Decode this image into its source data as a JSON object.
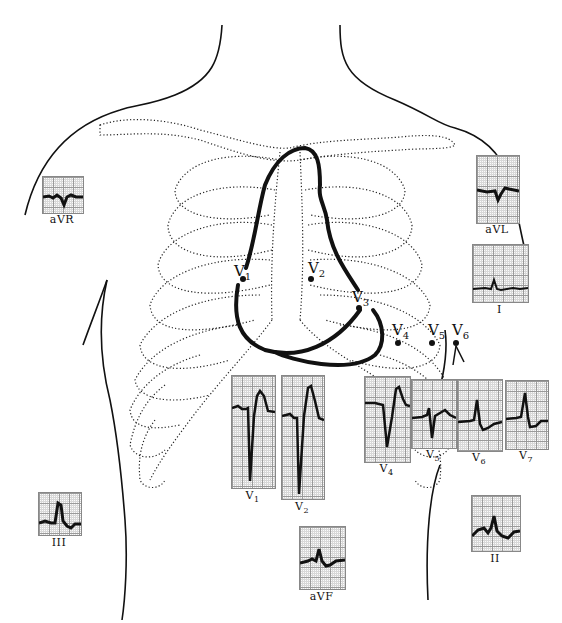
{
  "diagram": {
    "limb_leads": [
      {
        "id": "aVR",
        "label": "aVR",
        "x": 42,
        "y": 176,
        "w": 40,
        "h": 36
      },
      {
        "id": "aVL",
        "label": "aVL",
        "x": 476,
        "y": 155,
        "w": 42,
        "h": 67
      },
      {
        "id": "I",
        "label": "I",
        "x": 472,
        "y": 244,
        "w": 55,
        "h": 57
      },
      {
        "id": "III",
        "label": "III",
        "x": 38,
        "y": 492,
        "w": 42,
        "h": 42
      },
      {
        "id": "aVF",
        "label": "aVF",
        "x": 299,
        "y": 526,
        "w": 45,
        "h": 62
      },
      {
        "id": "II",
        "label": "II",
        "x": 471,
        "y": 495,
        "w": 48,
        "h": 55
      }
    ],
    "precordial_strips": [
      {
        "id": "V1",
        "label": "V",
        "sub": "1",
        "x": 231,
        "y": 375,
        "w": 43,
        "h": 112
      },
      {
        "id": "V2",
        "label": "V",
        "sub": "2",
        "x": 281,
        "y": 375,
        "w": 42,
        "h": 123
      },
      {
        "id": "V4",
        "label": "V",
        "sub": "4",
        "x": 364,
        "y": 376,
        "w": 45,
        "h": 85
      },
      {
        "id": "V5",
        "label": "V",
        "sub": "5",
        "x": 411,
        "y": 379,
        "w": 44,
        "h": 68
      },
      {
        "id": "V6",
        "label": "V",
        "sub": "6",
        "x": 457,
        "y": 379,
        "w": 44,
        "h": 71
      },
      {
        "id": "V7",
        "label": "V",
        "sub": "7",
        "x": 505,
        "y": 380,
        "w": 42,
        "h": 68
      }
    ],
    "electrodes": [
      {
        "id": "V1",
        "label": "V",
        "sub": "1",
        "dot_x": 243,
        "dot_y": 279,
        "text_x": 234,
        "text_y": 264
      },
      {
        "id": "V2",
        "label": "V",
        "sub": "2",
        "dot_x": 311,
        "dot_y": 279,
        "text_x": 308,
        "text_y": 261
      },
      {
        "id": "V3",
        "label": "V",
        "sub": "3",
        "dot_x": 359,
        "dot_y": 308,
        "text_x": 353,
        "text_y": 290
      },
      {
        "id": "V4",
        "label": "V",
        "sub": "4",
        "dot_x": 398,
        "dot_y": 343,
        "text_x": 392,
        "text_y": 322
      },
      {
        "id": "V5",
        "label": "V",
        "sub": "5",
        "dot_x": 432,
        "dot_y": 343,
        "text_x": 428,
        "text_y": 322
      },
      {
        "id": "V6",
        "label": "V",
        "sub": "6",
        "dot_x": 456,
        "dot_y": 343,
        "text_x": 452,
        "text_y": 322
      }
    ],
    "colors": {
      "ink": "#111111",
      "grid_major": "#9a9a9a",
      "grid_minor": "#d8d8d8",
      "paper": "#fbfbfb"
    }
  }
}
